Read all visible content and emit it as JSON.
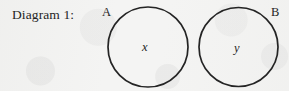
{
  "figure": {
    "caption": "Diagram 1:",
    "width": 289,
    "height": 91,
    "background_color": "#f4f4f3",
    "stroke_color": "#242424"
  },
  "sets": [
    {
      "name": "set-a",
      "label": "A",
      "member": "x",
      "center_x": 148,
      "center_y": 47,
      "radius": 40,
      "label_position": "upper-left"
    },
    {
      "name": "set-b",
      "label": "B",
      "member": "y",
      "center_x": 238.5,
      "center_y": 47,
      "radius": 39.5,
      "label_position": "upper-right"
    }
  ]
}
